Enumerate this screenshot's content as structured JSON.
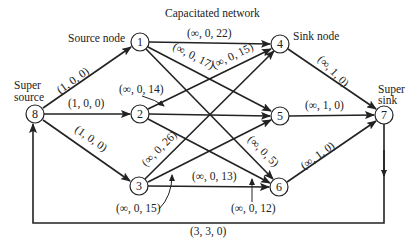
{
  "title": "Capacitated network",
  "annotations": {
    "source_node": "Source node",
    "sink_node": "Sink node",
    "super_source_line1": "Super",
    "super_source_line2": "source",
    "super_sink_line1": "Super",
    "super_sink_line2": "sink"
  },
  "nodes": [
    {
      "id": "1",
      "x": 140,
      "y": 42
    },
    {
      "id": "2",
      "x": 140,
      "y": 114
    },
    {
      "id": "3",
      "x": 139,
      "y": 186
    },
    {
      "id": "4",
      "x": 280,
      "y": 44
    },
    {
      "id": "5",
      "x": 280,
      "y": 116
    },
    {
      "id": "6",
      "x": 279,
      "y": 187
    },
    {
      "id": "7",
      "x": 384,
      "y": 115
    },
    {
      "id": "8",
      "x": 35,
      "y": 114
    }
  ],
  "edges": [
    {
      "from": "8",
      "to": "1",
      "label": "(1, 0, 0)"
    },
    {
      "from": "8",
      "to": "2",
      "label": "(1, 0, 0)"
    },
    {
      "from": "8",
      "to": "3",
      "label": "(1, 0, 0)"
    },
    {
      "from": "1",
      "to": "4",
      "label": "(∞, 0, 22)"
    },
    {
      "from": "1",
      "to": "5",
      "label": "(∞, 0, 17)"
    },
    {
      "from": "1",
      "to": "6",
      "label": "(∞, 0, 5)"
    },
    {
      "from": "2",
      "to": "4",
      "label": "(∞, 0, 15)"
    },
    {
      "from": "2",
      "to": "5",
      "label": "(∞, 0, 14)"
    },
    {
      "from": "2",
      "to": "6",
      "label": "(∞, 0, 12)"
    },
    {
      "from": "3",
      "to": "4",
      "label": "(∞, 0, 26)"
    },
    {
      "from": "3",
      "to": "5",
      "label": "(∞, 0, 15)"
    },
    {
      "from": "3",
      "to": "6",
      "label": "(∞, 0, 13)"
    },
    {
      "from": "4",
      "to": "7",
      "label": "(∞, 1, 0)"
    },
    {
      "from": "5",
      "to": "7",
      "label": "(∞, 1, 0)"
    },
    {
      "from": "6",
      "to": "7",
      "label": "(∞, 1, 0)"
    },
    {
      "from": "7",
      "to": "8",
      "label": "(3, 3, 0)"
    }
  ]
}
